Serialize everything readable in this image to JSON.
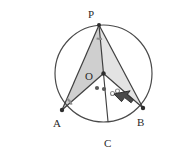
{
  "figure": {
    "kind": "circle-geometry-diagram",
    "title": "",
    "background_color": "#ffffff",
    "stroke_color": "#3a3a3a",
    "circle": {
      "name": "circumcircle",
      "center_label": "O",
      "cx": 103.5,
      "cy": 73.5,
      "r": 48.5,
      "stroke": "#4a4a4a",
      "stroke_width": 1.2,
      "fill": "none"
    },
    "points": [
      {
        "label": "P",
        "x": 99,
        "y": 25,
        "dot": true,
        "label_dx": -11,
        "label_dy": -16
      },
      {
        "label": "O",
        "x": 103.5,
        "y": 73.5,
        "dot": true,
        "label_dx": -18,
        "label_dy": -2
      },
      {
        "label": "A",
        "x": 62,
        "y": 110,
        "dot": true,
        "label_dx": -9,
        "label_dy": 8
      },
      {
        "label": "B",
        "x": 143,
        "y": 108,
        "dot": true,
        "label_dx": 6,
        "label_dy": 9
      },
      {
        "label": "C",
        "x": 108,
        "y": 121.5,
        "dot": false,
        "label_dx": -4,
        "label_dy": 17
      }
    ],
    "shaded_regions": [
      {
        "name": "triangle-P-O-A",
        "vertices": "P,O,A",
        "fill": "#cfcfcf",
        "opacity": 1
      },
      {
        "name": "triangle-P-O-B",
        "vertices": "P,O,B",
        "fill": "#e2e2e2",
        "opacity": 1
      }
    ],
    "segments": [
      {
        "name": "segment-PA",
        "from": "P",
        "to": "A"
      },
      {
        "name": "segment-PB",
        "from": "P",
        "to": "B"
      },
      {
        "name": "segment-PO",
        "from": "P",
        "to": "O"
      },
      {
        "name": "segment-OA",
        "from": "O",
        "to": "A"
      },
      {
        "name": "segment-OB",
        "from": "O",
        "to": "B"
      },
      {
        "name": "segment-OC",
        "from": "O",
        "to": "C"
      }
    ],
    "angle_marks": [
      {
        "name": "angle-mark-at-P",
        "at": "P",
        "style": "arc",
        "color": "#8d8d8d"
      },
      {
        "name": "angle-mark-at-A",
        "at": "A",
        "style": "arc",
        "color": "#8d8d8d"
      }
    ],
    "equal_angle_dots": [
      {
        "name": "filled-dot-1",
        "x": 97,
        "y": 88,
        "filled": true,
        "color": "#5a5a5a"
      },
      {
        "name": "filled-dot-2",
        "x": 104,
        "y": 89,
        "filled": true,
        "color": "#5a5a5a"
      },
      {
        "name": "hollow-dot-1",
        "x": 112,
        "y": 93,
        "filled": false,
        "color": "#8a8a8a"
      },
      {
        "name": "hollow-dot-2",
        "x": 117,
        "y": 91,
        "filled": false,
        "color": "#8a8a8a"
      }
    ],
    "cursor": {
      "name": "mouse-cursor-arrow",
      "x": 116,
      "y": 95,
      "rotation_deg": -28,
      "fill": "#4a4a4a",
      "stroke": "#2c2c2c"
    }
  },
  "labels": {
    "P": "P",
    "O": "O",
    "A": "A",
    "B": "B",
    "C": "C"
  }
}
